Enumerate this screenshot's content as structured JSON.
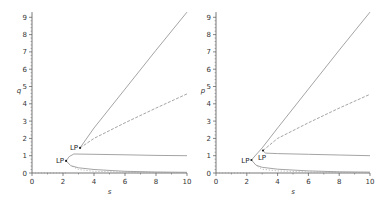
{
  "chart_data": [
    {
      "type": "line",
      "title": "",
      "xlabel": "s",
      "ylabel": "q",
      "xlim": [
        0,
        10
      ],
      "ylim": [
        0,
        9.3
      ],
      "xticks": [
        "0",
        "2",
        "4",
        "6",
        "8",
        "10"
      ],
      "yticks": [
        "0",
        "1",
        "2",
        "3",
        "4",
        "5",
        "6",
        "7",
        "8",
        "9"
      ],
      "grid": false,
      "legend": null,
      "annotations": [
        {
          "label": "LP",
          "x": 3.1,
          "y": 1.45
        },
        {
          "label": "LP",
          "x": 2.2,
          "y": 0.7
        }
      ],
      "series": [
        {
          "name": "upper branch A",
          "style": "solid",
          "points": [
            [
              3.1,
              1.45
            ],
            [
              4,
              2.6
            ],
            [
              6,
              4.85
            ],
            [
              8,
              7.1
            ],
            [
              10,
              9.3
            ]
          ]
        },
        {
          "name": "upper branch B",
          "style": "dashed",
          "points": [
            [
              3.1,
              1.45
            ],
            [
              4,
              2.0
            ],
            [
              6,
              2.9
            ],
            [
              8,
              3.75
            ],
            [
              10,
              4.57
            ]
          ]
        },
        {
          "name": "middle branch",
          "style": "solid",
          "points": [
            [
              2.2,
              0.7
            ],
            [
              2.4,
              0.95
            ],
            [
              2.7,
              1.1
            ],
            [
              4,
              1.08
            ],
            [
              6,
              1.05
            ],
            [
              8,
              1.02
            ],
            [
              10,
              1.0
            ]
          ]
        },
        {
          "name": "lower branch",
          "style": "solid",
          "points": [
            [
              2.2,
              0.7
            ],
            [
              2.5,
              0.42
            ],
            [
              3,
              0.3
            ],
            [
              4,
              0.2
            ],
            [
              6,
              0.1
            ],
            [
              8,
              0.06
            ],
            [
              10,
              0.04
            ]
          ]
        },
        {
          "name": "lower dotted branch",
          "style": "dotted",
          "points": [
            [
              2.6,
              0.38
            ],
            [
              3,
              0.2
            ],
            [
              4,
              0.1
            ],
            [
              6,
              0.05
            ],
            [
              10,
              0.02
            ]
          ]
        },
        {
          "name": "axis dotted branch",
          "style": "dotted",
          "points": [
            [
              0,
              0
            ],
            [
              2.2,
              0
            ]
          ]
        }
      ]
    },
    {
      "type": "line",
      "title": "",
      "xlabel": "s",
      "ylabel": "p",
      "xlim": [
        0,
        10
      ],
      "ylim": [
        0,
        9.3
      ],
      "xticks": [
        "0",
        "2",
        "4",
        "6",
        "8",
        "10"
      ],
      "yticks": [
        "0",
        "1",
        "2",
        "3",
        "4",
        "5",
        "6",
        "7",
        "8",
        "9"
      ],
      "grid": false,
      "legend": null,
      "annotations": [
        {
          "label": "LP",
          "x": 3.05,
          "y": 1.3
        },
        {
          "label": "LP",
          "x": 2.3,
          "y": 0.75
        }
      ],
      "series": [
        {
          "name": "upper branch A",
          "style": "solid",
          "points": [
            [
              2.3,
              0.75
            ],
            [
              3,
              1.45
            ],
            [
              4,
              2.6
            ],
            [
              6,
              4.85
            ],
            [
              8,
              7.1
            ],
            [
              10,
              9.3
            ]
          ]
        },
        {
          "name": "upper branch B",
          "style": "dashed",
          "points": [
            [
              3.05,
              1.3
            ],
            [
              4,
              2.0
            ],
            [
              6,
              2.9
            ],
            [
              8,
              3.75
            ],
            [
              10,
              4.55
            ]
          ]
        },
        {
          "name": "middle branch",
          "style": "solid",
          "points": [
            [
              3.05,
              1.3
            ],
            [
              3.2,
              1.15
            ],
            [
              4,
              1.12
            ],
            [
              6,
              1.08
            ],
            [
              8,
              1.04
            ],
            [
              10,
              1.0
            ]
          ]
        },
        {
          "name": "lower branch",
          "style": "solid",
          "points": [
            [
              2.3,
              0.75
            ],
            [
              2.6,
              0.45
            ],
            [
              3,
              0.33
            ],
            [
              4,
              0.22
            ],
            [
              6,
              0.12
            ],
            [
              8,
              0.07
            ],
            [
              10,
              0.05
            ]
          ]
        },
        {
          "name": "lower dotted branch",
          "style": "dotted",
          "points": [
            [
              2.7,
              0.38
            ],
            [
              3,
              0.22
            ],
            [
              4,
              0.12
            ],
            [
              6,
              0.06
            ],
            [
              10,
              0.02
            ]
          ]
        },
        {
          "name": "axis dotted branch",
          "style": "dotted",
          "points": [
            [
              0,
              0
            ],
            [
              2.3,
              0
            ]
          ]
        }
      ]
    }
  ],
  "panels": {
    "left": {
      "ylabel": "q",
      "xlabel": "s",
      "lp_upper": "LP",
      "lp_lower": "LP"
    },
    "right": {
      "ylabel": "p",
      "xlabel": "s",
      "lp_upper": "LP",
      "lp_lower": "LP"
    }
  },
  "colors": {
    "curve": "#9a9a9a",
    "axis": "#555555",
    "text": "#333333"
  }
}
